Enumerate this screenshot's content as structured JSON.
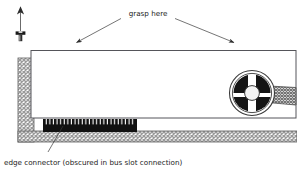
{
  "diagram": {
    "background_color": "#ffffff",
    "ink_color": "#2b2b2b",
    "labels": {
      "grasp_here": "grasp here",
      "edge_connector_caption": "edge connector (obscured in bus slot connection)"
    },
    "annotations": {
      "insertion_arrow_name": "up-arrow-icon",
      "screw_icon_name": "screw-head-icon",
      "grasp_arrow_left_name": "leader-arrow-left",
      "grasp_arrow_right_name": "leader-arrow-right",
      "caption_leader_name": "caption-leader-line"
    },
    "parts": [
      {
        "id": "chassis-bracket",
        "label": "chassis bracket",
        "fill_style": "cross-hatch",
        "color": "#8a8a8a",
        "x": 18,
        "y": 58,
        "w": 16,
        "h": 84
      },
      {
        "id": "chassis-base",
        "label": "chassis base",
        "fill_style": "cross-hatch",
        "color": "#8a8a8a",
        "x": 18,
        "y": 130,
        "w": 279,
        "h": 12
      },
      {
        "id": "bracket-tab-upper",
        "label": "bracket tab upper",
        "x": 34,
        "y": 63,
        "w": 10,
        "h": 4
      },
      {
        "id": "bracket-tab-lower",
        "label": "bracket tab lower",
        "x": 34,
        "y": 99,
        "w": 10,
        "h": 4
      },
      {
        "id": "card-body",
        "label": "expansion card body",
        "fill_style": "solid",
        "color": "#ffffff",
        "x": 31,
        "y": 50,
        "w": 265,
        "h": 68
      },
      {
        "id": "edge-connector",
        "label": "edge connector",
        "fill_style": "solid",
        "color": "#111111",
        "x": 43,
        "y": 119,
        "w": 94,
        "h": 13,
        "pin_count": 26
      },
      {
        "id": "fan-wheel",
        "label": "fan wheel",
        "color": "#141414",
        "cx": 252,
        "cy": 93,
        "r": 22,
        "hub_r": 7,
        "spoke_count": 4
      },
      {
        "id": "ribbon-cable",
        "label": "ribbon cable",
        "fill_style": "cross-hatch",
        "color": "#7d7d7d"
      }
    ]
  }
}
